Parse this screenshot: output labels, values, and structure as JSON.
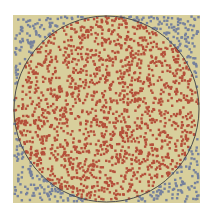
{
  "chart_data": {
    "type": "scatter",
    "title": "",
    "xlabel": "",
    "ylabel": "",
    "xlim": [
      -1,
      1
    ],
    "ylim": [
      -1,
      1
    ],
    "grid": false,
    "legend": null,
    "series": [
      {
        "name": "inside circle",
        "color": "#b4503a",
        "approx_count": 1600
      },
      {
        "name": "outside circle",
        "color": "#76819c",
        "approx_count": 440
      }
    ],
    "circle": {
      "cx": 0,
      "cy": 0,
      "r": 1,
      "stroke": "#4d4d4d"
    },
    "background": "#d8cf9c",
    "total_points": 2040,
    "seed": 12345
  }
}
